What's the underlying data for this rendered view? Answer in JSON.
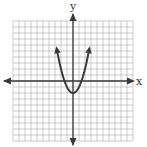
{
  "chart_data": {
    "type": "line",
    "title": "",
    "xlabel": "x",
    "ylabel": "y",
    "xlim": [
      -10,
      10
    ],
    "ylim": [
      -10,
      10
    ],
    "grid": true,
    "grid_step": 1,
    "series": [
      {
        "name": "parabola",
        "equation": "y = x^2 - 2",
        "vertex": [
          0,
          -2
        ],
        "x": [
          -2.7,
          -2,
          -1,
          0,
          1,
          2,
          2.7
        ],
        "values": [
          5.3,
          2,
          -1,
          -2,
          -1,
          2,
          5.3
        ],
        "arrows_at_ends": true
      }
    ]
  },
  "colors": {
    "grid": "#b5b5b5",
    "axis": "#3a3a3a",
    "curve": "#3a3a3a",
    "background": "#ffffff"
  }
}
